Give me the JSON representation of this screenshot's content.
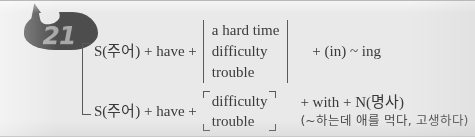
{
  "card": {
    "number_badge": "21",
    "background_color": "#e9e9e9",
    "badge_color": "#4d4d4d",
    "badge_text_color": "#a8a8a8",
    "ink_color": "#3a3a3a"
  },
  "rules": [
    {
      "id": "rule-1",
      "stem": "S(주어) + have +",
      "options": [
        "a hard time",
        "difficulty",
        "trouble"
      ],
      "tail": "+ (in) ~ ing",
      "gloss": ""
    },
    {
      "id": "rule-2",
      "stem": "S(주어) + have +",
      "options": [
        "difficulty",
        "trouble"
      ],
      "tail": "+ with + N(명사)",
      "gloss": "(~하는데 애를 먹다, 고생하다)"
    }
  ]
}
